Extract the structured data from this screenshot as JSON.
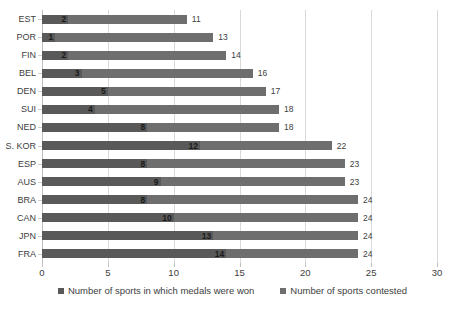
{
  "chart_data": {
    "type": "bar",
    "orientation": "horizontal",
    "stacked": true,
    "title": "",
    "xlabel": "",
    "ylabel": "",
    "xlim": [
      0,
      30
    ],
    "xticks": [
      0,
      5,
      10,
      15,
      20,
      25,
      30
    ],
    "grid": true,
    "legend_position": "bottom",
    "categories": [
      "EST",
      "POR",
      "FIN",
      "BEL",
      "DEN",
      "SUI",
      "NED",
      "S. KOR",
      "ESP",
      "AUS",
      "BRA",
      "CAN",
      "JPN",
      "FRA"
    ],
    "series": [
      {
        "name": "Number of sports in which medals were won",
        "color": "#595959",
        "values": [
          2,
          1,
          2,
          3,
          5,
          4,
          8,
          12,
          8,
          9,
          8,
          10,
          13,
          14
        ]
      },
      {
        "name": "Number of sports contested",
        "color": "#6e6e6e",
        "values": [
          11,
          13,
          14,
          16,
          17,
          18,
          18,
          22,
          23,
          23,
          24,
          24,
          24,
          24
        ]
      }
    ],
    "annotations": {
      "inner_labels": [
        "2",
        "1",
        "2",
        "3",
        "5",
        "4",
        "8",
        "12",
        "8",
        "9",
        "8",
        "10",
        "13",
        "14"
      ],
      "outer_labels": [
        "11",
        "13",
        "14",
        "16",
        "17",
        "18",
        "18",
        "22",
        "23",
        "23",
        "24",
        "24",
        "24",
        "24"
      ]
    }
  },
  "legend": {
    "items": [
      {
        "label": "Number of sports in which medals were won",
        "marker": "square-marker"
      },
      {
        "label": "Number of sports contested",
        "marker": "square-marker"
      }
    ]
  }
}
